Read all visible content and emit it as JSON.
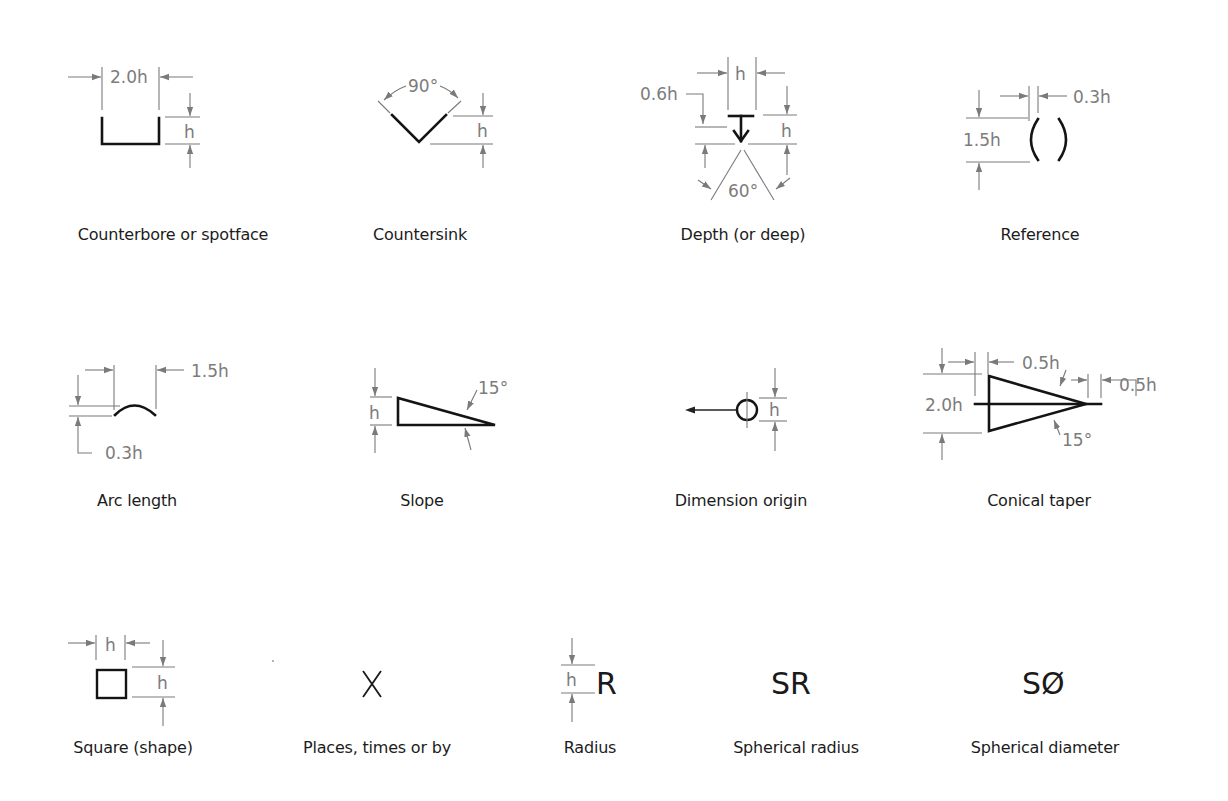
{
  "diagram": {
    "colors": {
      "background": "#ffffff",
      "symbol_stroke": "#141414",
      "dimension_stroke": "#7a7a7a",
      "dimension_text": "#7c7c7c",
      "caption_text": "#1c1c1c"
    },
    "symbols": [
      {
        "id": "counterbore",
        "caption": "Counterbore or spotface",
        "dims": {
          "width": "2.0h",
          "height": "h"
        }
      },
      {
        "id": "countersink",
        "caption": "Countersink",
        "dims": {
          "angle": "90°",
          "height": "h"
        }
      },
      {
        "id": "depth",
        "caption": "Depth (or deep)",
        "dims": {
          "width": "h",
          "offset": "0.6h",
          "height": "h",
          "angle": "60°"
        }
      },
      {
        "id": "reference",
        "caption": "Reference",
        "dims": {
          "gap": "0.3h",
          "height": "1.5h"
        },
        "glyph": "( )"
      },
      {
        "id": "arc-length",
        "caption": "Arc length",
        "dims": {
          "width": "1.5h",
          "height": "0.3h"
        }
      },
      {
        "id": "slope",
        "caption": "Slope",
        "dims": {
          "height": "h",
          "angle": "15°"
        }
      },
      {
        "id": "dimension-origin",
        "caption": "Dimension origin",
        "dims": {
          "diameter": "h"
        }
      },
      {
        "id": "conical-taper",
        "caption": "Conical taper",
        "dims": {
          "left_offset": "0.5h",
          "right_offset": "0.5h",
          "height": "2.0h",
          "angle": "15°"
        }
      },
      {
        "id": "square",
        "caption": "Square (shape)",
        "dims": {
          "width": "h",
          "height": "h"
        }
      },
      {
        "id": "places",
        "caption": "Places, times or by",
        "glyph": "X"
      },
      {
        "id": "radius",
        "caption": "Radius",
        "dims": {
          "height": "h"
        },
        "glyph": "R"
      },
      {
        "id": "spherical-radius",
        "caption": "Spherical radius",
        "glyph": "SR"
      },
      {
        "id": "spherical-diameter",
        "caption": "Spherical diameter",
        "glyph": "SØ"
      }
    ]
  }
}
